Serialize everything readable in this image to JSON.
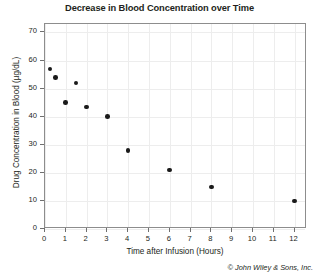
{
  "chart_data": {
    "type": "scatter",
    "title": "Decrease in Blood Concentration over Time",
    "xlabel": "Time after Infusion (Hours)",
    "ylabel": "Drug Concentration in Blood (µg/dL)",
    "xlim": [
      0,
      12.6
    ],
    "ylim": [
      0,
      73
    ],
    "grid": true,
    "legend": null,
    "marker": "filled-circle",
    "marker_color": "#1a1a1a",
    "xticks": [
      0,
      1,
      2,
      3,
      4,
      5,
      6,
      7,
      8,
      9,
      10,
      11,
      12
    ],
    "xticklabels": [
      "0",
      "1",
      "2",
      "3",
      "4",
      "5",
      "6",
      "7",
      "8",
      "9",
      "10",
      "11",
      "12"
    ],
    "yticks": [
      0,
      10,
      20,
      30,
      40,
      50,
      60,
      70
    ],
    "yticklabels": [
      "0",
      "10",
      "20",
      "30",
      "40",
      "50",
      "60",
      "70"
    ],
    "x": [
      0.25,
      0.5,
      1.0,
      1.5,
      2.0,
      3.0,
      4.0,
      6.0,
      8.0,
      12.0
    ],
    "y": [
      57,
      54,
      45,
      52,
      43.5,
      40,
      28,
      21,
      15,
      10
    ],
    "points": [
      {
        "x": 0.25,
        "y": 57
      },
      {
        "x": 0.5,
        "y": 54
      },
      {
        "x": 1.0,
        "y": 45
      },
      {
        "x": 1.5,
        "y": 52
      },
      {
        "x": 2.0,
        "y": 43.5
      },
      {
        "x": 3.0,
        "y": 40
      },
      {
        "x": 4.0,
        "y": 28
      },
      {
        "x": 6.0,
        "y": 21
      },
      {
        "x": 8.0,
        "y": 15
      },
      {
        "x": 12.0,
        "y": 10
      }
    ]
  },
  "footer": {
    "copyright": "© John Wiley & Sons, Inc."
  }
}
